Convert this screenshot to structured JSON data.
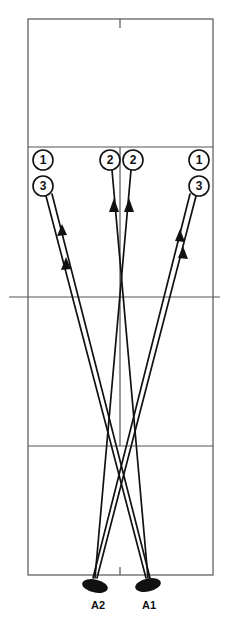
{
  "diagram": {
    "type": "volleyball-court-attack-routes",
    "colors": {
      "court_lines": "#555555",
      "paths": "#111111",
      "background": "#ffffff"
    },
    "court": {
      "left": 28,
      "right": 213,
      "top": 19,
      "bottom": 575,
      "net_y": 297,
      "net_extends": [
        9,
        220
      ],
      "attack_line_top_y": 147,
      "attack_line_bottom_y": 446,
      "center_x": 120
    },
    "target_positions": [
      {
        "id": "pos-1-left",
        "label": "1",
        "x": 43,
        "y": 160
      },
      {
        "id": "pos-3-left",
        "label": "3",
        "x": 43,
        "y": 186
      },
      {
        "id": "pos-2-left",
        "label": "2",
        "x": 110,
        "y": 160
      },
      {
        "id": "pos-2-right",
        "label": "2",
        "x": 133,
        "y": 160
      },
      {
        "id": "pos-1-right",
        "label": "1",
        "x": 199,
        "y": 160
      },
      {
        "id": "pos-3-right",
        "label": "3",
        "x": 199,
        "y": 186
      }
    ],
    "players": [
      {
        "id": "A2",
        "label": "A2",
        "x": 95,
        "y": 585
      },
      {
        "id": "A1",
        "label": "A1",
        "x": 148,
        "y": 585
      }
    ],
    "routes": [
      {
        "from": "A1",
        "to": "pos-1-left"
      },
      {
        "from": "A1",
        "to": "pos-3-left"
      },
      {
        "from": "A1",
        "to": "pos-2-left"
      },
      {
        "from": "A2",
        "to": "pos-2-right"
      },
      {
        "from": "A2",
        "to": "pos-1-right"
      },
      {
        "from": "A2",
        "to": "pos-3-right"
      }
    ]
  }
}
